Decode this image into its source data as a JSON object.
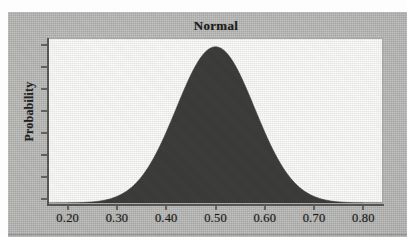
{
  "figure": {
    "title": "Normal",
    "y_axis_title": "Probability"
  },
  "colors": {
    "page_background": "#b3b3b1",
    "plot_background": "#efefed",
    "curve_fill": "#3a3a38",
    "axis_line": "#4a4a48",
    "text": "#1c1c1c",
    "plot_border": "#a9a9a7"
  },
  "chart_data": {
    "type": "area",
    "title": "Normal",
    "xlabel": "",
    "ylabel": "Probability",
    "xlim": [
      0.16,
      0.84
    ],
    "ylim": [
      0,
      1.05
    ],
    "grid": false,
    "legend": null,
    "x_tick_labels": [
      "0.20",
      "0.30",
      "0.40",
      "0.50",
      "0.60",
      "0.70",
      "0.80"
    ],
    "x_tick_values": [
      0.2,
      0.3,
      0.4,
      0.5,
      0.6,
      0.7,
      0.8
    ],
    "y_tick_labels": [],
    "y_tick_count": 8,
    "distribution": {
      "name": "Normal",
      "mean": 0.5,
      "std_dev": 0.08
    },
    "x": [
      0.16,
      0.18,
      0.2,
      0.22,
      0.24,
      0.26,
      0.28,
      0.3,
      0.32,
      0.34,
      0.36,
      0.38,
      0.4,
      0.42,
      0.44,
      0.46,
      0.48,
      0.5,
      0.52,
      0.54,
      0.56,
      0.58,
      0.6,
      0.62,
      0.64,
      0.66,
      0.68,
      0.7,
      0.72,
      0.74,
      0.76,
      0.78,
      0.8,
      0.82,
      0.84
    ],
    "values": [
      0.0001,
      0.0004,
      0.0012,
      0.0033,
      0.0081,
      0.018,
      0.0363,
      0.0663,
      0.1096,
      0.1645,
      0.2239,
      0.2982,
      0.3867,
      0.4868,
      0.5945,
      0.7041,
      0.8084,
      0.8825,
      0.9692,
      0.9692,
      0.8825,
      0.8084,
      0.7041,
      0.5945,
      0.4868,
      0.3867,
      0.2982,
      0.2239,
      0.1645,
      0.1096,
      0.0663,
      0.0363,
      0.018,
      0.0081,
      0.0033
    ]
  }
}
